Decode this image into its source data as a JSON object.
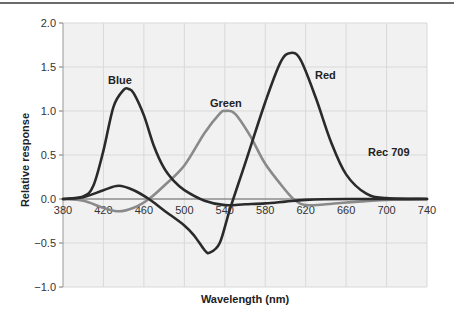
{
  "chart_data": {
    "type": "line",
    "title": "",
    "xlabel": "Wavelength (nm)",
    "ylabel": "Relative response",
    "xlim": [
      380,
      740
    ],
    "ylim": [
      -1.0,
      2.0
    ],
    "x_ticks": [
      380,
      420,
      460,
      500,
      540,
      580,
      620,
      660,
      700,
      740
    ],
    "y_ticks": [
      "2.0",
      "1.5",
      "1.0",
      "0.5",
      "0.0",
      "−0.5",
      "−1.0"
    ],
    "y_tick_values": [
      2.0,
      1.5,
      1.0,
      0.5,
      0.0,
      -0.5,
      -1.0
    ],
    "grid": true,
    "annotations": [
      "Rec 709"
    ],
    "series": [
      {
        "name": "Blue",
        "color": "#2a2a2a",
        "x": [
          380,
          400,
          410,
          420,
          430,
          440,
          445,
          450,
          460,
          470,
          480,
          490,
          500,
          520,
          540,
          560,
          580,
          600,
          620,
          660,
          740
        ],
        "values": [
          0,
          0.03,
          0.15,
          0.55,
          1.05,
          1.24,
          1.25,
          1.2,
          0.95,
          0.6,
          0.35,
          0.2,
          0.1,
          -0.02,
          -0.07,
          -0.06,
          -0.05,
          -0.03,
          -0.01,
          0,
          0
        ]
      },
      {
        "name": "Green",
        "color": "#8a8a8a",
        "x": [
          380,
          400,
          420,
          435,
          450,
          465,
          480,
          500,
          520,
          535,
          540,
          550,
          565,
          580,
          600,
          610,
          620,
          640,
          660,
          700,
          740
        ],
        "values": [
          0,
          -0.02,
          -0.1,
          -0.14,
          -0.1,
          0,
          0.15,
          0.38,
          0.75,
          0.97,
          1.0,
          0.97,
          0.72,
          0.4,
          0.1,
          -0.02,
          -0.07,
          -0.06,
          -0.04,
          -0.01,
          0
        ]
      },
      {
        "name": "Red",
        "color": "#2a2a2a",
        "x": [
          380,
          400,
          420,
          435,
          450,
          465,
          480,
          500,
          510,
          520,
          525,
          535,
          545,
          560,
          580,
          595,
          605,
          615,
          630,
          645,
          660,
          680,
          700,
          740
        ],
        "values": [
          0,
          0.02,
          0.1,
          0.15,
          0.1,
          0,
          -0.13,
          -0.3,
          -0.42,
          -0.58,
          -0.61,
          -0.5,
          -0.12,
          0.4,
          1.1,
          1.55,
          1.66,
          1.58,
          1.15,
          0.65,
          0.28,
          0.06,
          0.01,
          0
        ]
      }
    ]
  },
  "labels": {
    "blue": "Blue",
    "green": "Green",
    "red": "Red",
    "rec": "Rec 709",
    "xlabel": "Wavelength (nm)",
    "ylabel": "Relative response"
  }
}
